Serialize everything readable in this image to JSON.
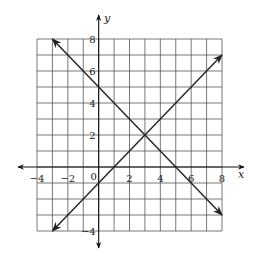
{
  "chart_data": {
    "type": "line",
    "title": "",
    "xlabel": "x",
    "ylabel": "y",
    "xlim": [
      -4,
      8
    ],
    "ylim": [
      -4,
      8
    ],
    "grid": true,
    "x_tick_labels": [
      "-4",
      "-2",
      "0",
      "2",
      "4",
      "6",
      "8"
    ],
    "y_tick_labels": [
      "8",
      "6",
      "4",
      "2",
      "-4"
    ],
    "x_ticks": [
      -4,
      -2,
      0,
      2,
      4,
      6,
      8
    ],
    "y_ticks": [
      8,
      6,
      4,
      2,
      -4
    ],
    "series": [
      {
        "name": "decreasing line",
        "equation": "y = -x + 5",
        "points": [
          [
            -3,
            8
          ],
          [
            8,
            -3
          ]
        ],
        "arrows": "both"
      },
      {
        "name": "increasing line",
        "equation": "y = x - 1",
        "points": [
          [
            -3,
            -4
          ],
          [
            8,
            7
          ]
        ],
        "arrows": "both"
      }
    ],
    "intersection": [
      3,
      2
    ]
  }
}
